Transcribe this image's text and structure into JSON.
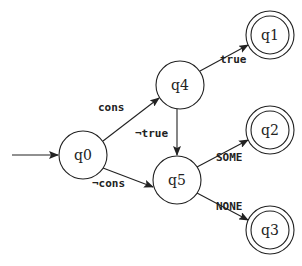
{
  "diagram": {
    "type": "finite-state-automaton",
    "start_state": "q0",
    "nodes": [
      {
        "id": "q0",
        "label": "q0",
        "x": 83,
        "y": 155,
        "accepting": false
      },
      {
        "id": "q4",
        "label": "q4",
        "x": 180,
        "y": 85,
        "accepting": false
      },
      {
        "id": "q5",
        "label": "q5",
        "x": 177,
        "y": 180,
        "accepting": false
      },
      {
        "id": "q1",
        "label": "q1",
        "x": 270,
        "y": 35,
        "accepting": true
      },
      {
        "id": "q2",
        "label": "q2",
        "x": 270,
        "y": 130,
        "accepting": true
      },
      {
        "id": "q3",
        "label": "q3",
        "x": 270,
        "y": 230,
        "accepting": true
      }
    ],
    "edges": [
      {
        "from": "start",
        "to": "q0",
        "label": ""
      },
      {
        "from": "q0",
        "to": "q4",
        "label": "cons"
      },
      {
        "from": "q0",
        "to": "q5",
        "label": "¬cons"
      },
      {
        "from": "q4",
        "to": "q1",
        "label": "true"
      },
      {
        "from": "q4",
        "to": "q5",
        "label": "¬true"
      },
      {
        "from": "q5",
        "to": "q2",
        "label": "SOME"
      },
      {
        "from": "q5",
        "to": "q3",
        "label": "NONE"
      }
    ]
  }
}
